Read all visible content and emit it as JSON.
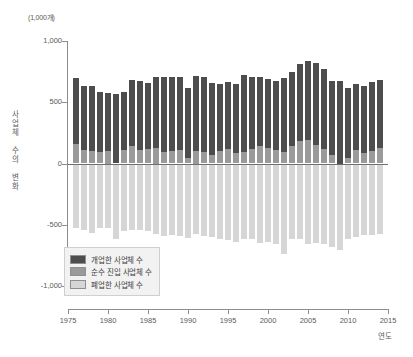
{
  "chart_data": {
    "type": "bar",
    "stacked": true,
    "title": "",
    "subtitle": "",
    "unit_label": "(1,000개)",
    "xlabel": "연도",
    "ylabel": "사업체 수의 변화",
    "ylim": [
      -1000,
      1000
    ],
    "xlim": [
      1975,
      2015
    ],
    "yticks": [
      1000,
      500,
      0,
      -500,
      -1000
    ],
    "ytick_labels": [
      "1,000",
      "500",
      "0",
      "-500",
      "-1,000"
    ],
    "xticks": [
      1975,
      1980,
      1985,
      1990,
      1995,
      2000,
      2005,
      2010,
      2015
    ],
    "xtick_labels": [
      "1975",
      "1980",
      "1985",
      "1990",
      "1995",
      "2000",
      "2005",
      "2010",
      "2015"
    ],
    "grid": false,
    "legend_position": "lower-left",
    "categories": [
      1976,
      1977,
      1978,
      1979,
      1980,
      1981,
      1982,
      1983,
      1984,
      1985,
      1986,
      1987,
      1988,
      1989,
      1990,
      1991,
      1992,
      1993,
      1994,
      1995,
      1996,
      1997,
      1998,
      1999,
      2000,
      2001,
      2002,
      2003,
      2004,
      2005,
      2006,
      2007,
      2008,
      2009,
      2010,
      2011,
      2012,
      2013,
      2014
    ],
    "series": [
      {
        "name": "개업한 사업체 수",
        "color": "#4d4d4d",
        "values": [
          540,
          520,
          525,
          490,
          475,
          565,
          470,
          545,
          565,
          545,
          580,
          615,
          600,
          595,
          575,
          615,
          610,
          590,
          540,
          545,
          560,
          625,
          590,
          565,
          560,
          565,
          600,
          610,
          630,
          645,
          665,
          650,
          600,
          675,
          575,
          540,
          545,
          560,
          555
        ]
      },
      {
        "name": "순수 진입 사업체 수",
        "color": "#9a9a9a",
        "values": [
          160,
          110,
          105,
          95,
          100,
          -20,
          110,
          140,
          110,
          115,
          125,
          95,
          105,
          110,
          45,
          100,
          95,
          70,
          105,
          120,
          85,
          95,
          115,
          140,
          130,
          110,
          95,
          140,
          180,
          190,
          155,
          120,
          70,
          -90,
          45,
          110,
          85,
          105,
          130
        ]
      },
      {
        "name": "폐업한 사업체 수",
        "color": "#d6d6d6",
        "values": [
          -530,
          -545,
          -565,
          -525,
          -530,
          -615,
          -550,
          -540,
          -545,
          -555,
          -575,
          -590,
          -580,
          -595,
          -605,
          -575,
          -595,
          -600,
          -620,
          -625,
          -640,
          -615,
          -620,
          -645,
          -640,
          -655,
          -735,
          -620,
          -615,
          -660,
          -650,
          -655,
          -680,
          -705,
          -615,
          -600,
          -580,
          -585,
          -575
        ]
      }
    ],
    "legend": [
      {
        "label": "개업한 사업체 수",
        "color": "#4d4d4d"
      },
      {
        "label": "순수 진입 사업체 수",
        "color": "#9a9a9a"
      },
      {
        "label": "폐업한 사업체 수",
        "color": "#d6d6d6"
      }
    ]
  }
}
